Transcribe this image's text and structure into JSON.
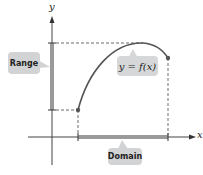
{
  "diagram": {
    "axes": {
      "x_label": "x",
      "y_label": "y"
    },
    "labels": {
      "range": "Range",
      "domain": "Domain",
      "function": "y = f(x)"
    },
    "colors": {
      "curve": "#555555",
      "axis": "#444444",
      "range_bar": "#9a9a9a",
      "domain_bar": "#9a9a9a",
      "callout_bg": "#d2d3d5",
      "dashed": "#444444"
    },
    "curve": {
      "start_point": [
        78,
        110
      ],
      "peak_point": [
        143,
        43
      ],
      "end_point": [
        168,
        58
      ],
      "endpoints_closed": true
    }
  }
}
